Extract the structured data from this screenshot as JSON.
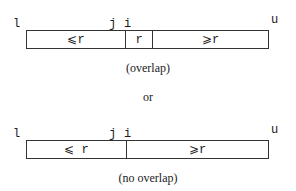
{
  "diagram1": {
    "labels": {
      "l": "l",
      "j": "j",
      "i": "i",
      "u": "u"
    },
    "cells": [
      "⩽r",
      "r",
      "⩾r"
    ],
    "caption": "(overlap)"
  },
  "separator": "or",
  "diagram2": {
    "labels": {
      "l": "l",
      "j": "j",
      "i": "i",
      "u": "u"
    },
    "cells": [
      "⩽ r",
      "⩾r"
    ],
    "caption": "(no overlap)"
  }
}
